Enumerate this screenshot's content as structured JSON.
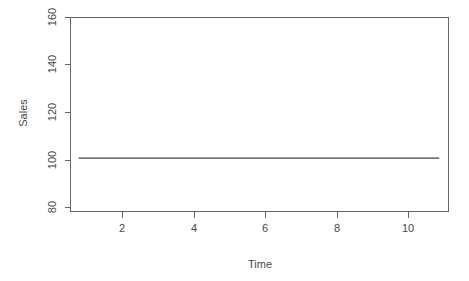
{
  "chart_data": {
    "type": "line",
    "title": "",
    "subtitle": "",
    "xlabel": "Time",
    "ylabel": "Sales",
    "xlim": [
      0.78,
      11.0
    ],
    "ylim": [
      76.5,
      162.5
    ],
    "grid": false,
    "legend": null,
    "x_ticks": [
      2,
      4,
      6,
      8,
      10
    ],
    "x_tick_labels": [
      "2",
      "4",
      "6",
      "8",
      "10"
    ],
    "y_ticks": [
      80,
      100,
      120,
      140,
      160
    ],
    "y_tick_labels": [
      "80",
      "100",
      "120",
      "140",
      "160"
    ],
    "series": [
      {
        "name": "Sales",
        "color": "#434343",
        "x": [
          1,
          2,
          3,
          4,
          5,
          6,
          7,
          8,
          9,
          10,
          10.75
        ],
        "values": [
          100,
          100,
          100,
          100,
          100,
          100,
          100,
          100,
          100,
          100,
          100
        ]
      }
    ],
    "annotations": []
  },
  "axes": {
    "y_axis_title": "Sales",
    "x_axis_title": "Time",
    "y_tick_labels": [
      "160",
      "140",
      "120",
      "100",
      "80"
    ],
    "x_tick_labels": [
      "2",
      "4",
      "6",
      "8",
      "10"
    ]
  },
  "style": {
    "background": "#ffffff",
    "line_color": "#434343",
    "axis_color": "#666666",
    "text_color": "#4a4a4a"
  }
}
